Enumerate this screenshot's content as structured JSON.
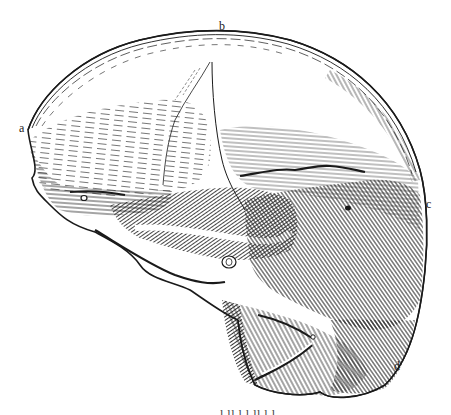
{
  "figure": {
    "labels": [
      {
        "id": "a",
        "text": "a",
        "x": 19,
        "y": 122
      },
      {
        "id": "b",
        "text": "b",
        "x": 219,
        "y": 20
      },
      {
        "id": "c",
        "text": "c",
        "x": 426,
        "y": 198
      },
      {
        "id": "d",
        "text": "d",
        "x": 394,
        "y": 360
      }
    ],
    "caption_fragment": "l  ll  l  l  ll  l  l"
  },
  "colors": {
    "ink": "#1a1a1a",
    "paper": "#ffffff"
  }
}
